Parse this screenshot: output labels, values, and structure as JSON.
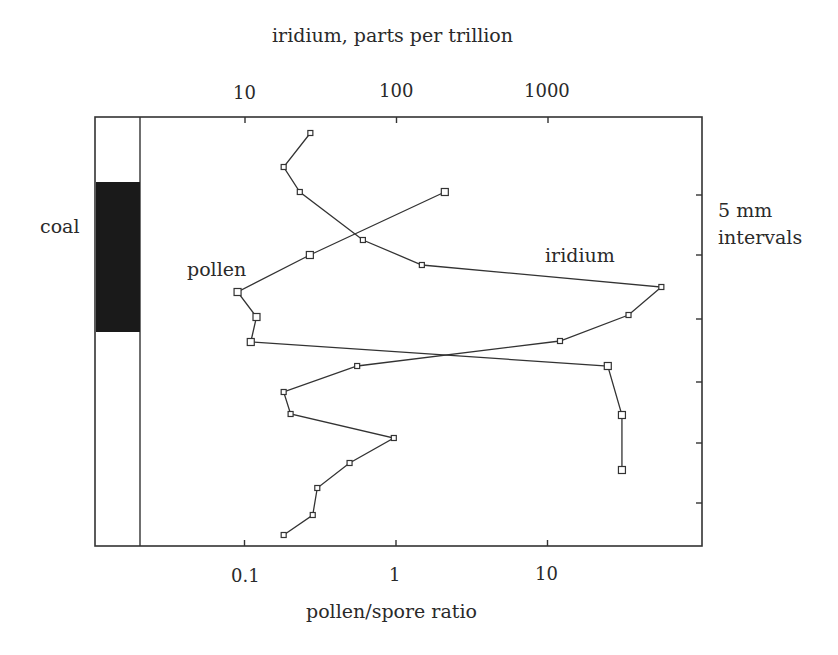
{
  "chart_data": {
    "type": "line",
    "title": "",
    "top_axis": {
      "label": "iridium, parts per trillion",
      "scale": "log",
      "ticks": [
        {
          "value": 10,
          "label": "10"
        },
        {
          "value": 100,
          "label": "100"
        },
        {
          "value": 1000,
          "label": "1000"
        }
      ]
    },
    "bottom_axis": {
      "label": "pollen/spore ratio",
      "scale": "log",
      "ticks": [
        {
          "value": 0.1,
          "label": "0.1"
        },
        {
          "value": 1,
          "label": "1"
        },
        {
          "value": 10,
          "label": "10"
        }
      ]
    },
    "right_axis": {
      "label_line1": "5 mm",
      "label_line2": "intervals",
      "tick_count": 6
    },
    "lithology_column": {
      "label": "coal",
      "coal_color": "#1a1a1a"
    },
    "grid": false,
    "series": [
      {
        "name": "iridium",
        "label": "iridium",
        "axis": "top",
        "units": "ppt",
        "marker": "open-square-small",
        "points": [
          {
            "depth_px": 133,
            "value": 27
          },
          {
            "depth_px": 167,
            "value": 18
          },
          {
            "depth_px": 192,
            "value": 23
          },
          {
            "depth_px": 240,
            "value": 60
          },
          {
            "depth_px": 265,
            "value": 147
          },
          {
            "depth_px": 287,
            "value": 5600
          },
          {
            "depth_px": 315,
            "value": 3400
          },
          {
            "depth_px": 341,
            "value": 1200
          },
          {
            "depth_px": 366,
            "value": 55
          },
          {
            "depth_px": 392,
            "value": 18
          },
          {
            "depth_px": 414,
            "value": 20
          },
          {
            "depth_px": 438,
            "value": 96
          },
          {
            "depth_px": 463,
            "value": 49
          },
          {
            "depth_px": 488,
            "value": 30
          },
          {
            "depth_px": 515,
            "value": 28
          },
          {
            "depth_px": 535,
            "value": 18
          }
        ]
      },
      {
        "name": "pollen",
        "label": "pollen",
        "axis": "bottom",
        "units": "ratio",
        "marker": "open-square-large",
        "points": [
          {
            "depth_px": 192,
            "value": 2.1
          },
          {
            "depth_px": 255,
            "value": 0.27
          },
          {
            "depth_px": 292,
            "value": 0.09
          },
          {
            "depth_px": 317,
            "value": 0.12
          },
          {
            "depth_px": 342,
            "value": 0.11
          },
          {
            "depth_px": 366,
            "value": 25
          },
          {
            "depth_px": 415,
            "value": 31
          },
          {
            "depth_px": 470,
            "value": 31
          }
        ]
      }
    ]
  }
}
